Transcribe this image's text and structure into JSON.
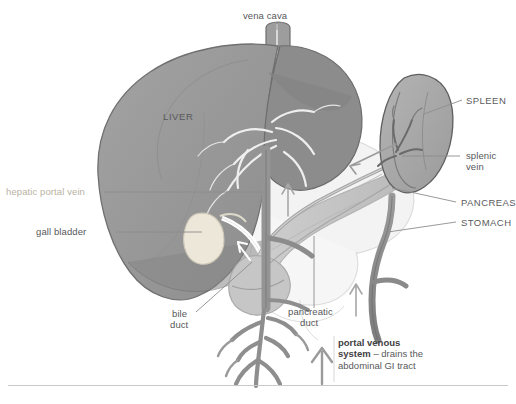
{
  "figure": {
    "background": "#ffffff"
  },
  "labels": {
    "vena_cava": "vena cava",
    "liver": "LIVER",
    "hepatic_portal_vein": "hepatic portal vein",
    "gall_bladder": "gall bladder",
    "bile_duct_line1": "bile",
    "bile_duct_line2": "duct",
    "pancreatic_duct_line1": "pancreatic",
    "pancreatic_duct_line2": "duct",
    "spleen": "SPLEEN",
    "splenic_vein_line1": "splenic",
    "splenic_vein_line2": "vein",
    "pancreas": "PANCREAS",
    "stomach": "STOMACH"
  },
  "caption": {
    "bold": "portal venous system",
    "rest": " – drains the abdominal GI tract"
  },
  "colors": {
    "liver_fill": "#9a9a9a",
    "liver_fill_dark": "#8a8a8a",
    "liver_edge": "#6f6f6f",
    "spleen_fill": "#a9a9a9",
    "spleen_edge": "#5f5f5f",
    "pancreas_fill": "#c3c3c3",
    "vessel_fill": "#8e8e8e",
    "vessel_edge": "#5e5e5e",
    "gallbladder_fill": "#ece7d8",
    "stomach_outline": "#d8d8d8",
    "label_text": "#57585a",
    "tan_text": "#b9b2a4",
    "rule": "#c9c9c9",
    "arrow": "#9b9b9b"
  },
  "icon_names": {
    "flow_arrow_up_large": "arrow-up-icon",
    "flow_arrow_left": "arrow-left-icon",
    "flow_arrow_up_small": "arrow-up-icon"
  }
}
